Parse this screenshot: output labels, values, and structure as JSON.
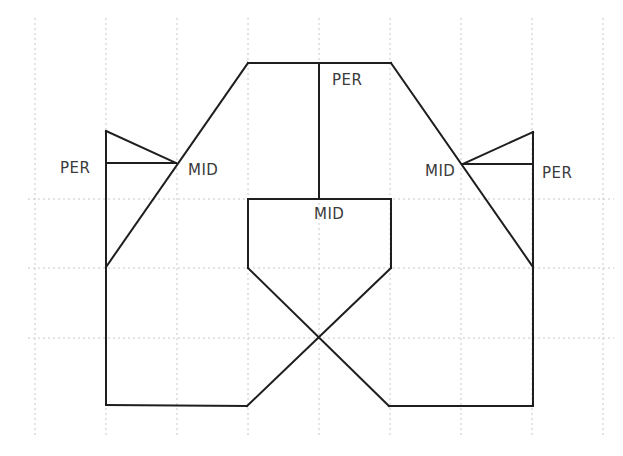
{
  "diagram": {
    "colors": {
      "background": "#ffffff",
      "line": "#1e1e1e",
      "grid": "#c8c8c8",
      "label": "#3a3a3a"
    },
    "grid": {
      "vertical_x": [
        35,
        106,
        177,
        248,
        319,
        390,
        461,
        532,
        603
      ],
      "vertical_y_range": [
        18,
        437
      ],
      "horizontal_y": [
        199,
        268,
        338
      ],
      "horizontal_x_range": [
        28,
        614
      ]
    },
    "segments": [
      {
        "name": "left-outer-vertical",
        "x1": 106,
        "y1": 131,
        "x2": 106,
        "y2": 405
      },
      {
        "name": "left-triangle-top",
        "x1": 106,
        "y1": 131,
        "x2": 176,
        "y2": 163
      },
      {
        "name": "left-perpendicular",
        "x1": 106,
        "y1": 163,
        "x2": 176,
        "y2": 163
      },
      {
        "name": "left-slope",
        "x1": 106,
        "y1": 267,
        "x2": 248,
        "y2": 63
      },
      {
        "name": "top-edge",
        "x1": 248,
        "y1": 63,
        "x2": 391,
        "y2": 63
      },
      {
        "name": "center-perpendicular",
        "x1": 319,
        "y1": 63,
        "x2": 319,
        "y2": 199
      },
      {
        "name": "right-slope",
        "x1": 391,
        "y1": 63,
        "x2": 533,
        "y2": 267
      },
      {
        "name": "right-outer-vertical",
        "x1": 533,
        "y1": 132,
        "x2": 533,
        "y2": 406
      },
      {
        "name": "right-triangle-top",
        "x1": 463,
        "y1": 164,
        "x2": 533,
        "y2": 132
      },
      {
        "name": "right-perpendicular",
        "x1": 463,
        "y1": 164,
        "x2": 533,
        "y2": 164
      },
      {
        "name": "inner-box-top",
        "x1": 248,
        "y1": 199,
        "x2": 391,
        "y2": 199
      },
      {
        "name": "inner-box-left",
        "x1": 248,
        "y1": 199,
        "x2": 248,
        "y2": 268
      },
      {
        "name": "inner-box-right",
        "x1": 391,
        "y1": 199,
        "x2": 391,
        "y2": 268
      },
      {
        "name": "cross-left-to-right",
        "x1": 248,
        "y1": 268,
        "x2": 389,
        "y2": 406
      },
      {
        "name": "cross-right-to-left",
        "x1": 391,
        "y1": 268,
        "x2": 247,
        "y2": 406
      },
      {
        "name": "bottom-left-edge",
        "x1": 106,
        "y1": 405,
        "x2": 247,
        "y2": 406
      },
      {
        "name": "bottom-right-edge",
        "x1": 389,
        "y1": 406,
        "x2": 533,
        "y2": 406
      }
    ],
    "labels": [
      {
        "name": "label-per-left",
        "text": "PER",
        "x": 60,
        "y": 173
      },
      {
        "name": "label-mid-left",
        "text": "MID",
        "x": 188,
        "y": 175
      },
      {
        "name": "label-per-top",
        "text": "PER",
        "x": 332,
        "y": 85
      },
      {
        "name": "label-mid-center",
        "text": "MID",
        "x": 314,
        "y": 219
      },
      {
        "name": "label-mid-right",
        "text": "MID",
        "x": 425,
        "y": 176
      },
      {
        "name": "label-per-right",
        "text": "PER",
        "x": 542,
        "y": 178
      }
    ]
  }
}
